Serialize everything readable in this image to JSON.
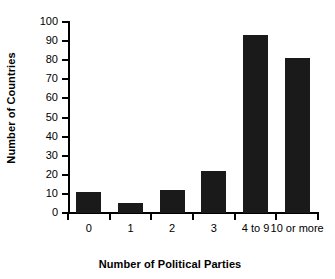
{
  "chart_data": {
    "type": "bar",
    "title": "",
    "xlabel": "Number of Political Parties",
    "ylabel": "Number of Countries",
    "categories": [
      "0",
      "1",
      "2",
      "3",
      "4 to 9",
      "10 or more"
    ],
    "values": [
      11,
      5,
      12,
      22,
      93,
      81
    ],
    "ylim": [
      0,
      100
    ],
    "ytick_labels": [
      "0",
      "10",
      "20",
      "30",
      "40",
      "50",
      "60",
      "70",
      "80",
      "90",
      "100"
    ],
    "ytick_values": [
      0,
      10,
      20,
      30,
      40,
      50,
      60,
      70,
      80,
      90,
      100
    ],
    "grid": false,
    "legend": false,
    "bar_color": "#1a1a1a",
    "axis_color": "#000000",
    "background_color": "#ffffff"
  }
}
